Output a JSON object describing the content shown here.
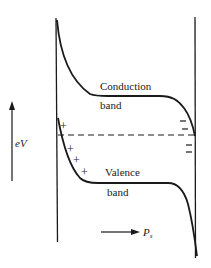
{
  "diagram": {
    "type": "band-diagram",
    "labels": {
      "conduction_line1": "Conduction",
      "conduction_line2": "band",
      "valence_line1": "Valence",
      "valence_line2": "band",
      "energy_axis": "eV",
      "polarization_main": "P",
      "polarization_sub": "s"
    },
    "positive_charges": [
      "+",
      "+",
      "+",
      "+"
    ],
    "negative_charges": [
      "−",
      "−",
      "−",
      "−"
    ],
    "colors": {
      "ink": "#1a1a1a",
      "background": "#ffffff"
    }
  }
}
